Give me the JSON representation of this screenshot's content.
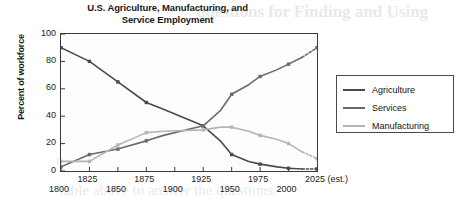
{
  "chart_data": {
    "type": "line",
    "title": "U.S. Agriculture, Manufacturing, and Service Employment",
    "title_line1": "U.S. Agriculture, Manufacturing, and",
    "title_line2": "Service Employment",
    "xlabel": "",
    "ylabel": "Percent of workforce",
    "ylim": [
      0,
      100
    ],
    "yticks": [
      0,
      20,
      40,
      60,
      80,
      100
    ],
    "ytick_labels": [
      "0",
      "20",
      "40",
      "60",
      "80",
      "100"
    ],
    "xlim": [
      1800,
      2025
    ],
    "xticks": [
      1800,
      1825,
      1850,
      1875,
      1900,
      1925,
      1950,
      1975,
      2000,
      2025
    ],
    "xtick_labels": [
      "1800",
      "1825",
      "1850",
      "1875",
      "1900",
      "1925",
      "1950",
      "1975",
      "2000",
      "2025 (est.)"
    ],
    "grid": false,
    "legend_position": "right",
    "x": [
      1800,
      1825,
      1850,
      1875,
      1890,
      1925,
      1940,
      1950,
      1965,
      1975,
      1990,
      2000,
      2012,
      2025
    ],
    "series": [
      {
        "name": "Agriculture",
        "color": "#4a4a4a",
        "values": [
          90,
          80,
          65,
          50,
          45,
          33,
          22,
          12,
          7,
          5,
          3,
          2,
          1.5,
          1.5
        ]
      },
      {
        "name": "Services",
        "color": "#6b6b6b",
        "values": [
          3,
          12,
          16,
          22,
          26,
          33,
          44,
          56,
          63,
          69,
          74,
          78,
          83,
          90
        ]
      },
      {
        "name": "Manufacturing",
        "color": "#b5b5b5",
        "values": [
          7,
          7,
          19,
          28,
          29,
          30,
          32,
          32,
          29,
          26,
          23,
          20,
          14,
          9
        ]
      }
    ],
    "estimate_note": "(est.)",
    "estimate_segment_dashed": true
  },
  "legend": {
    "items": [
      {
        "label": "Agriculture",
        "color": "#4a4a4a"
      },
      {
        "label": "Services",
        "color": "#6b6b6b"
      },
      {
        "label": "Manufacturing",
        "color": "#b5b5b5"
      }
    ]
  },
  "bleed_through": {
    "lines": [
      "questions for Finding and Using",
      "the data leading to the table result.",
      "million dollars. Were it not for increased",
      "economic conditions with a workforce",
      "than 20 in the United States at the time.",
      "communities and the number of workers",
      "the employment sector in the regions",
      "manufacturing and service were on the",
      "table above to answer the questions."
    ]
  }
}
